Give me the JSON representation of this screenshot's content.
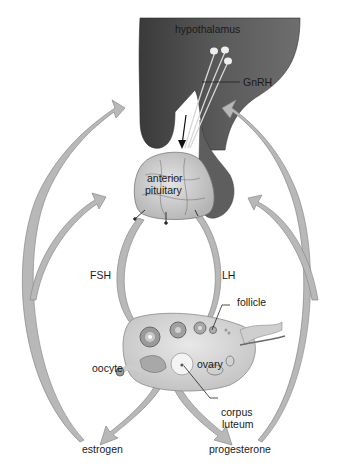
{
  "diagram": {
    "nodes": [
      {
        "id": "hypothalamus",
        "label": "hypothalamus"
      },
      {
        "id": "anterior_pituitary",
        "label_line1": "anterior",
        "label_line2": "pituitary"
      },
      {
        "id": "ovary",
        "label": "ovary"
      },
      {
        "id": "follicle",
        "label": "follicle"
      },
      {
        "id": "oocyte",
        "label": "oocyte"
      },
      {
        "id": "corpus_luteum",
        "label_line1": "corpus",
        "label_line2": "luteum"
      },
      {
        "id": "estrogen",
        "label": "estrogen"
      },
      {
        "id": "progesterone",
        "label": "progesterone"
      }
    ],
    "hormones": {
      "gnrh": "GnRH",
      "fsh": "FSH",
      "lh": "LH"
    },
    "edges": [
      {
        "from": "hypothalamus",
        "to": "anterior_pituitary",
        "label": "GnRH"
      },
      {
        "from": "anterior_pituitary",
        "to": "ovary",
        "label": "FSH"
      },
      {
        "from": "anterior_pituitary",
        "to": "ovary",
        "label": "LH"
      },
      {
        "from": "ovary",
        "to": "estrogen"
      },
      {
        "from": "ovary",
        "to": "progesterone"
      },
      {
        "from": "estrogen",
        "to": "hypothalamus",
        "type": "feedback"
      },
      {
        "from": "estrogen",
        "to": "anterior_pituitary",
        "type": "feedback"
      },
      {
        "from": "progesterone",
        "to": "hypothalamus",
        "type": "feedback"
      },
      {
        "from": "progesterone",
        "to": "anterior_pituitary",
        "type": "feedback"
      }
    ],
    "colors": {
      "brain_dark": "#4a4a4a",
      "brain_mid": "#6b6b6b",
      "pituitary_fill": "#cfcfcf",
      "arrow_fill": "#b8b8b8",
      "arrow_stroke": "#8a8a8a",
      "ovary_fill": "#d8d8d8",
      "follicle_ring": "#8c8c8c",
      "text": "#1a1a1a"
    }
  }
}
